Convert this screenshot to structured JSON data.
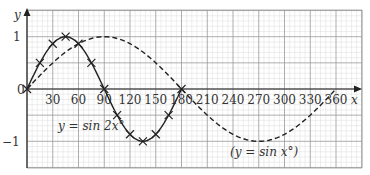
{
  "chart_data": {
    "type": "line",
    "title": "",
    "xlabel": "x",
    "ylabel": "y",
    "xlim": [
      0,
      390
    ],
    "ylim": [
      -1.5,
      1.5
    ],
    "x_ticks": [
      30,
      60,
      90,
      120,
      150,
      180,
      210,
      240,
      270,
      300,
      330,
      360
    ],
    "x_tick_labels": [
      "30",
      "60",
      "90",
      "120",
      "150",
      "180",
      "210",
      "240",
      "270",
      "300",
      "330",
      "360"
    ],
    "y_ticks": [
      1,
      -1
    ],
    "y_tick_labels": [
      "1",
      "−1"
    ],
    "origin_label": "0",
    "grid": true,
    "series": [
      {
        "name": "y = sin 2x°",
        "style": "solid",
        "markers": "cross",
        "x": [
          0,
          15,
          30,
          45,
          60,
          75,
          90,
          105,
          120,
          135,
          150,
          165,
          180
        ],
        "y": [
          0,
          0.5,
          0.87,
          1,
          0.87,
          0.5,
          0,
          -0.5,
          -0.87,
          -1,
          -0.87,
          -0.5,
          0
        ]
      },
      {
        "name": "(y = sin x°)",
        "style": "dashed",
        "markers": "none",
        "x": [
          0,
          30,
          60,
          90,
          120,
          150,
          180,
          210,
          240,
          270,
          300,
          330,
          360
        ],
        "y": [
          0,
          0.5,
          0.87,
          1,
          0.87,
          0.5,
          0,
          -0.5,
          -0.87,
          -1,
          -0.87,
          -0.5,
          0
        ]
      }
    ],
    "annotations": [
      {
        "text": "y = sin 2x°",
        "near_x": 60,
        "near_y": -0.65
      },
      {
        "text": "(y = sin x°)",
        "near_x": 270,
        "near_y": -1.25
      }
    ]
  },
  "labels": {
    "y_axis": "y",
    "x_axis": "x",
    "origin": "0",
    "y_one": "1",
    "y_minus_one": "−1",
    "sin2x": "y = sin 2x°",
    "sinx": "(y = sin x°)"
  }
}
